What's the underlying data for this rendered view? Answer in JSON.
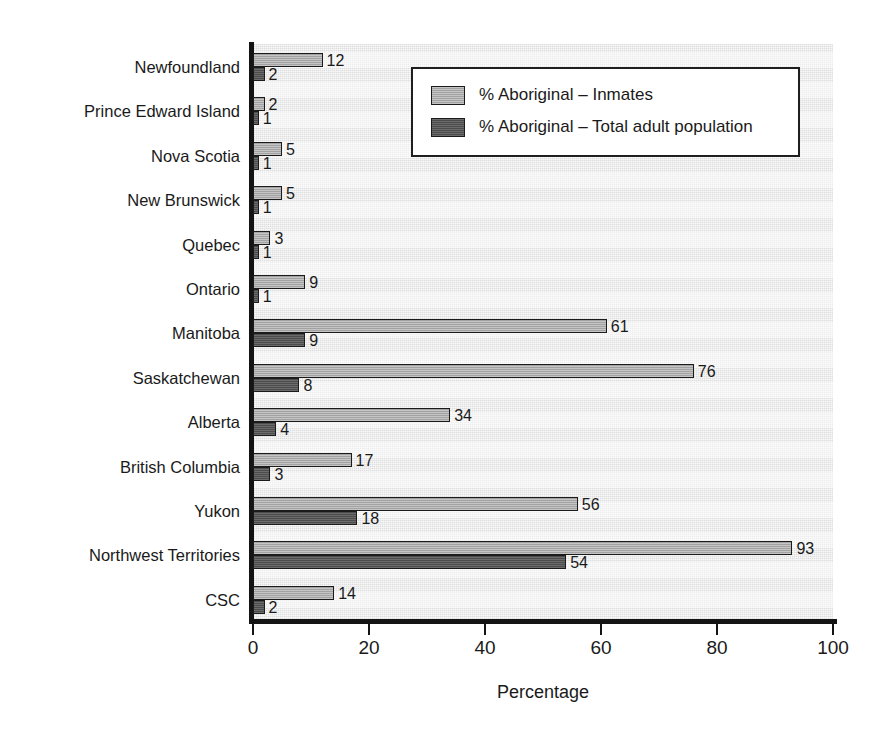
{
  "chart_data": {
    "type": "bar",
    "orientation": "horizontal",
    "title": "",
    "xlabel": "Percentage",
    "ylabel": "",
    "xlim": [
      0,
      100
    ],
    "xticks": [
      0,
      20,
      40,
      60,
      80,
      100
    ],
    "grid": false,
    "legend_position": "top-right",
    "categories": [
      "Newfoundland",
      "Prince Edward Island",
      "Nova Scotia",
      "New Brunswick",
      "Quebec",
      "Ontario",
      "Manitoba",
      "Saskatchewan",
      "Alberta",
      "British Columbia",
      "Yukon",
      "Northwest Territories",
      "CSC"
    ],
    "series": [
      {
        "name": "% Aboriginal – Inmates",
        "color": "#acacac",
        "values": [
          12,
          2,
          5,
          5,
          3,
          9,
          61,
          76,
          34,
          17,
          56,
          93,
          14
        ]
      },
      {
        "name": "% Aboriginal – Total adult population",
        "color": "#555555",
        "values": [
          2,
          1,
          1,
          1,
          1,
          1,
          9,
          8,
          4,
          3,
          18,
          54,
          2
        ]
      }
    ]
  },
  "legend": {
    "entries": [
      "% Aboriginal – Inmates",
      "% Aboriginal – Total adult population"
    ]
  },
  "axis": {
    "x_title": "Percentage",
    "x_tick_labels": [
      "0",
      "20",
      "40",
      "60",
      "80",
      "100"
    ]
  }
}
